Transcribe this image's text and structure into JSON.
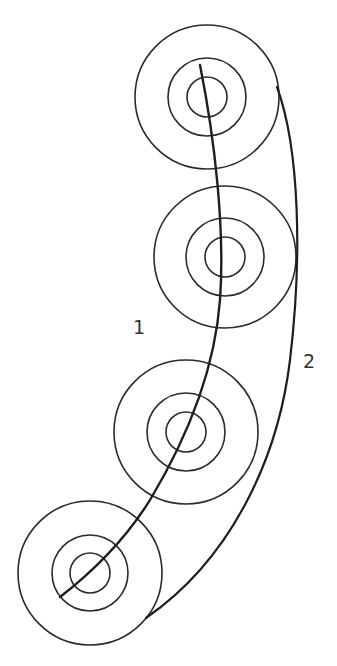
{
  "diagram": {
    "type": "concentric-circle-trajectories",
    "circle_sets": [
      {
        "id": "set-1",
        "center": [
          207,
          97
        ],
        "radii": [
          72,
          39,
          20
        ]
      },
      {
        "id": "set-2",
        "center": [
          225,
          257
        ],
        "radii": [
          71,
          39,
          20
        ]
      },
      {
        "id": "set-3",
        "center": [
          186,
          432
        ],
        "radii": [
          72,
          39,
          20
        ]
      },
      {
        "id": "set-4",
        "center": [
          90,
          573
        ],
        "radii": [
          72,
          38,
          20
        ]
      }
    ],
    "paths": [
      {
        "id": "path-1",
        "label": "1",
        "description": "curve through centers of circle sets"
      },
      {
        "id": "path-2",
        "label": "2",
        "description": "curve tangent along outer edges of circle sets"
      }
    ],
    "labels": {
      "path1": "1",
      "path2": "2"
    },
    "colors": {
      "stroke": "#1e1e1e",
      "background": "#ffffff"
    }
  }
}
